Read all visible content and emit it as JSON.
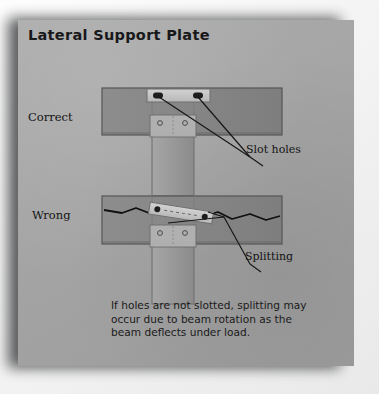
{
  "page": {
    "title": "Lateral Support Plate",
    "background_color": "#a5a5a5",
    "outer_background_color": "#f4f4f4",
    "shadow_color": "#2f3133"
  },
  "labels": {
    "correct": "Correct",
    "wrong": "Wrong",
    "slot_holes": "Slot holes",
    "splitting": "Splitting"
  },
  "caption": {
    "line1": "If holes are not slotted, splitting may",
    "line2": "occur due to beam rotation as the",
    "line3": "beam deflects under load."
  },
  "diagram": {
    "type": "technical-illustration",
    "panels": [
      {
        "name": "correct",
        "label": "Correct",
        "description": "Horizontal beam with lateral support plate fixed above the column; plate has slotted holes allowing beam rotation.",
        "plate_orientation": "level",
        "hole_type": "slot",
        "hole_count": 2,
        "crack": false
      },
      {
        "name": "wrong",
        "label": "Wrong",
        "description": "Plate tilted by beam rotation; round holes restrain the beam and a horizontal split propagates through the beam.",
        "plate_orientation": "tilted",
        "hole_type": "round",
        "hole_count": 2,
        "crack": true
      }
    ],
    "colors": {
      "beam_face": "#8e8e8e",
      "beam_edge": "#5f5f5f",
      "column_face": "#9a9a9a",
      "plate_light": "#c9c9c9",
      "hole_dark": "#1d1d1d",
      "line": "#151515"
    }
  }
}
